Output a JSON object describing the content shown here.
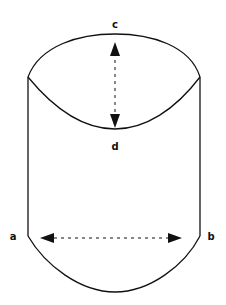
{
  "diagram": {
    "stroke_color": "#111111",
    "background": "#ffffff",
    "labels": {
      "c": "c",
      "d": "d",
      "a": "a",
      "b": "b"
    },
    "arrows": [
      {
        "name": "vertical-arrow",
        "from": "c",
        "to": "d",
        "style": "dashed",
        "bidirectional": true
      },
      {
        "name": "horizontal-arrow",
        "from": "a",
        "to": "b",
        "style": "dashed",
        "bidirectional": true
      }
    ]
  }
}
